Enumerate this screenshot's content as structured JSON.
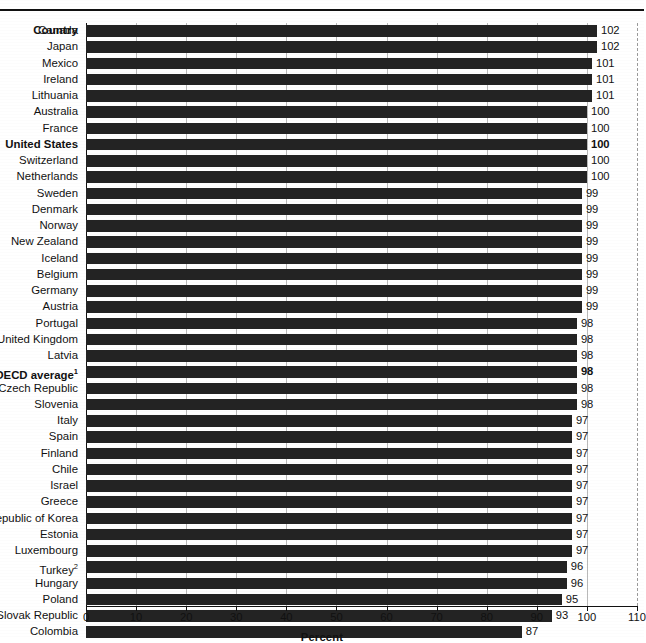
{
  "top_clipped_caption": "",
  "header": {
    "country_column": "Country"
  },
  "axis": {
    "xlabel": "Percent",
    "ticks": [
      "0",
      "10",
      "20",
      "30",
      "40",
      "50",
      "60",
      "70",
      "80",
      "90",
      "100",
      "110"
    ]
  },
  "footnote_markers": {
    "oecd": "1",
    "turkey": "2"
  },
  "chart_data": {
    "type": "bar",
    "orientation": "horizontal",
    "title": "",
    "xlabel": "Percent",
    "ylabel": "Country",
    "xlim": [
      0,
      110
    ],
    "xticks": [
      0,
      10,
      20,
      30,
      40,
      50,
      60,
      70,
      80,
      90,
      100,
      110
    ],
    "grid": true,
    "legend": "none",
    "categories": [
      "Canada",
      "Japan",
      "Mexico",
      "Ireland",
      "Lithuania",
      "Australia",
      "France",
      "United States",
      "Switzerland",
      "Netherlands",
      "Sweden",
      "Denmark",
      "Norway",
      "New Zealand",
      "Iceland",
      "Belgium",
      "Germany",
      "Austria",
      "Portugal",
      "United Kingdom",
      "Latvia",
      "OECD average",
      "Czech Republic",
      "Slovenia",
      "Italy",
      "Spain",
      "Finland",
      "Chile",
      "Israel",
      "Greece",
      "Republic of Korea",
      "Estonia",
      "Luxembourg",
      "Turkey",
      "Hungary",
      "Poland",
      "Slovak Republic",
      "Colombia"
    ],
    "values": [
      102,
      102,
      101,
      101,
      101,
      100,
      100,
      100,
      100,
      100,
      99,
      99,
      99,
      99,
      99,
      99,
      99,
      99,
      98,
      98,
      98,
      98,
      98,
      98,
      97,
      97,
      97,
      97,
      97,
      97,
      97,
      97,
      97,
      96,
      96,
      95,
      93,
      87
    ],
    "highlighted": [
      "United States",
      "OECD average"
    ]
  },
  "rows": [
    {
      "label": "Canada",
      "value": "102",
      "sup": "",
      "highlight": false
    },
    {
      "label": "Japan",
      "value": "102",
      "sup": "",
      "highlight": false
    },
    {
      "label": "Mexico",
      "value": "101",
      "sup": "",
      "highlight": false
    },
    {
      "label": "Ireland",
      "value": "101",
      "sup": "",
      "highlight": false
    },
    {
      "label": "Lithuania",
      "value": "101",
      "sup": "",
      "highlight": false
    },
    {
      "label": "Australia",
      "value": "100",
      "sup": "",
      "highlight": false
    },
    {
      "label": "France",
      "value": "100",
      "sup": "",
      "highlight": false
    },
    {
      "label": "United States",
      "value": "100",
      "sup": "",
      "highlight": true
    },
    {
      "label": "Switzerland",
      "value": "100",
      "sup": "",
      "highlight": false
    },
    {
      "label": "Netherlands",
      "value": "100",
      "sup": "",
      "highlight": false
    },
    {
      "label": "Sweden",
      "value": "99",
      "sup": "",
      "highlight": false
    },
    {
      "label": "Denmark",
      "value": "99",
      "sup": "",
      "highlight": false
    },
    {
      "label": "Norway",
      "value": "99",
      "sup": "",
      "highlight": false
    },
    {
      "label": "New Zealand",
      "value": "99",
      "sup": "",
      "highlight": false
    },
    {
      "label": "Iceland",
      "value": "99",
      "sup": "",
      "highlight": false
    },
    {
      "label": "Belgium",
      "value": "99",
      "sup": "",
      "highlight": false
    },
    {
      "label": "Germany",
      "value": "99",
      "sup": "",
      "highlight": false
    },
    {
      "label": "Austria",
      "value": "99",
      "sup": "",
      "highlight": false
    },
    {
      "label": "Portugal",
      "value": "98",
      "sup": "",
      "highlight": false
    },
    {
      "label": "United Kingdom",
      "value": "98",
      "sup": "",
      "highlight": false
    },
    {
      "label": "Latvia",
      "value": "98",
      "sup": "",
      "highlight": false
    },
    {
      "label": "OECD average",
      "value": "98",
      "sup": "1",
      "highlight": true
    },
    {
      "label": "Czech Republic",
      "value": "98",
      "sup": "",
      "highlight": false
    },
    {
      "label": "Slovenia",
      "value": "98",
      "sup": "",
      "highlight": false
    },
    {
      "label": "Italy",
      "value": "97",
      "sup": "",
      "highlight": false
    },
    {
      "label": "Spain",
      "value": "97",
      "sup": "",
      "highlight": false
    },
    {
      "label": "Finland",
      "value": "97",
      "sup": "",
      "highlight": false
    },
    {
      "label": "Chile",
      "value": "97",
      "sup": "",
      "highlight": false
    },
    {
      "label": "Israel",
      "value": "97",
      "sup": "",
      "highlight": false
    },
    {
      "label": "Greece",
      "value": "97",
      "sup": "",
      "highlight": false
    },
    {
      "label": "Republic of Korea",
      "value": "97",
      "sup": "",
      "highlight": false
    },
    {
      "label": "Estonia",
      "value": "97",
      "sup": "",
      "highlight": false
    },
    {
      "label": "Luxembourg",
      "value": "97",
      "sup": "",
      "highlight": false
    },
    {
      "label": "Turkey",
      "value": "96",
      "sup": "2",
      "highlight": false
    },
    {
      "label": "Hungary",
      "value": "96",
      "sup": "",
      "highlight": false
    },
    {
      "label": "Poland",
      "value": "95",
      "sup": "",
      "highlight": false
    },
    {
      "label": "Slovak Republic",
      "value": "93",
      "sup": "",
      "highlight": false
    },
    {
      "label": "Colombia",
      "value": "87",
      "sup": "",
      "highlight": false
    }
  ]
}
